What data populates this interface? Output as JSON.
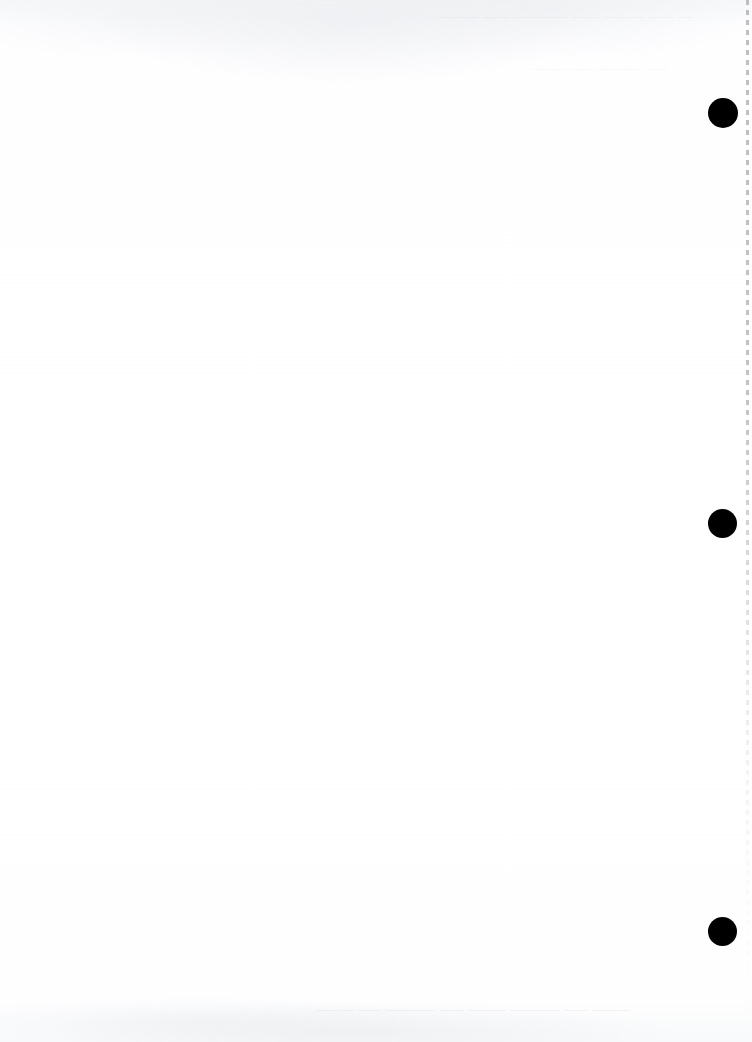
{
  "document": {
    "kind": "scanned-blank-page",
    "page_width": 752,
    "page_height": 1042,
    "orientation": "portrait",
    "background_color": "#fefeff",
    "body_text": ""
  },
  "marks": {
    "color": "#000000",
    "label": "registration mark",
    "items": [
      {
        "id": "registration-mark-1",
        "cx": 723,
        "cy": 113,
        "d": 30
      },
      {
        "id": "registration-mark-2",
        "cx": 722,
        "cy": 523,
        "d": 29
      },
      {
        "id": "registration-mark-3",
        "cx": 722,
        "cy": 931,
        "d": 29
      }
    ]
  },
  "edge": {
    "perforation_label": "dotted page edge",
    "color": "#b0b4ba"
  },
  "artifacts": {
    "top_line_1": "— —— ——— —— ———— —— ———",
    "top_line_2": "—— ———— —— ———",
    "bottom_line": "——— —— ———— ——— —— ———— —— ———"
  }
}
